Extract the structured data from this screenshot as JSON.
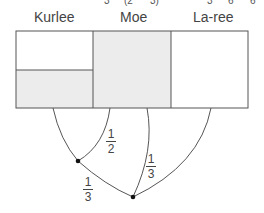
{
  "top_cutoff": [
    "3",
    "(2",
    "3)",
    "3",
    "6",
    "6"
  ],
  "columns": [
    {
      "name": "Kurlee"
    },
    {
      "name": "Moe"
    },
    {
      "name": "La-ree"
    }
  ],
  "fractions": [
    {
      "num": "1",
      "den": "2"
    },
    {
      "num": "1",
      "den": "3"
    },
    {
      "num": "1",
      "den": "3"
    }
  ],
  "colors": {
    "shade": "#ececec",
    "line": "#555555"
  }
}
